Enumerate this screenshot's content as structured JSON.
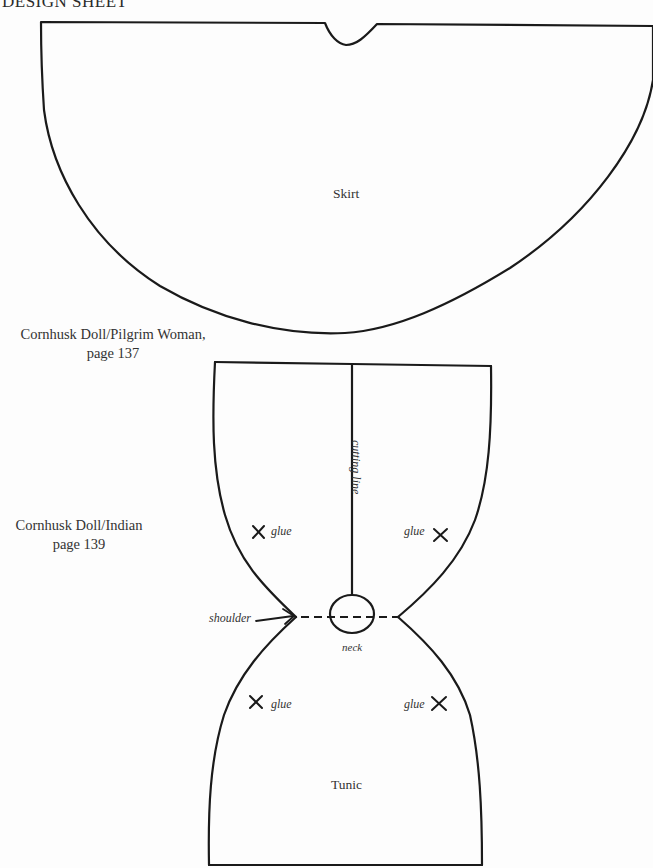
{
  "sheet": {
    "title": "DESIGN SHEET"
  },
  "references": {
    "pilgrim": {
      "line1": "Cornhusk Doll/Pilgrim Woman,",
      "line2": "page 137"
    },
    "indian": {
      "line1": "Cornhusk Doll/Indian",
      "line2": "page 139"
    }
  },
  "skirt": {
    "label": "Skirt"
  },
  "tunic": {
    "label": "Tunic",
    "annotations": {
      "cutting_line": "cutting line",
      "shoulder": "shoulder",
      "neck": "neck",
      "glue_top_left": "glue",
      "glue_top_right": "glue",
      "glue_bottom_left": "glue",
      "glue_bottom_right": "glue"
    },
    "icons": {
      "glue_mark": "x-mark-icon",
      "shoulder_arrow": "arrow-right-icon"
    }
  },
  "colors": {
    "ink": "#1a1a1a",
    "paper": "#fdfdfd"
  }
}
